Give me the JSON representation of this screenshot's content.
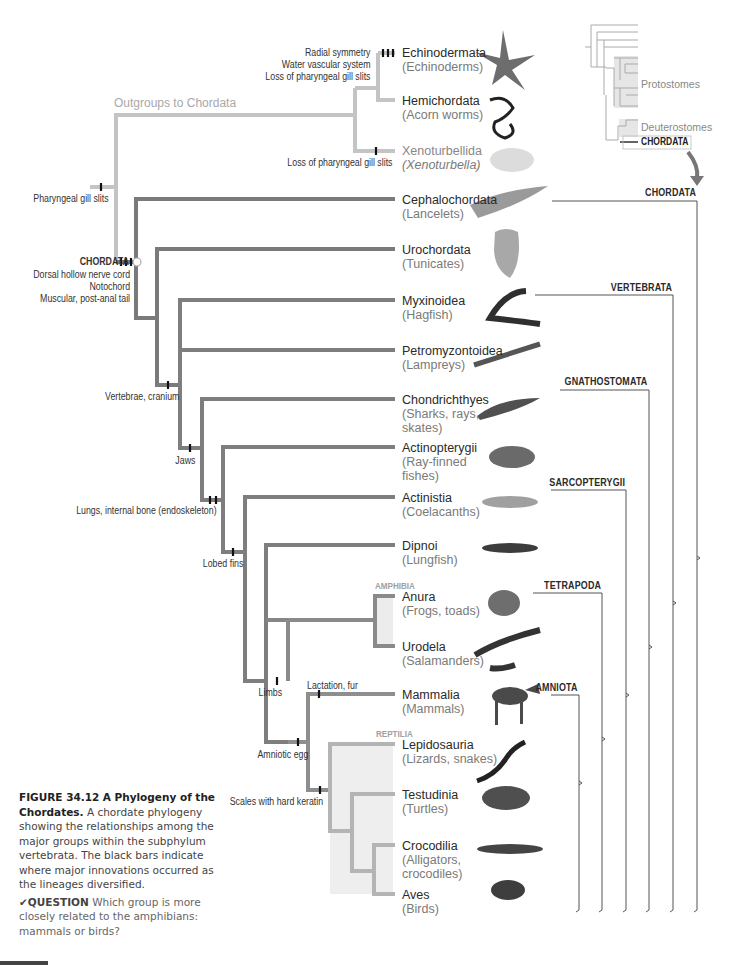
{
  "figure": {
    "number": "FIGURE 34.12",
    "title": "A Phylogeny of the Chordates.",
    "caption": "A chordate phylogeny showing the relationships among the major groups within the subphylum vertebrata. The black bars indicate where major innovations occurred as the lineages diversified.",
    "question_label": "QUESTION",
    "question_text": "Which group is more closely related to the amphibians: mammals or birds?",
    "question_icon": "checkmark-icon"
  },
  "inset": {
    "protostomes": "Protostomes",
    "deuterostomes": "Deuterostomes",
    "chordata": "CHORDATA",
    "arrow_icon": "curved-arrow-down-icon"
  },
  "outgroup_label": "Outgroups to Chordata",
  "taxa": [
    {
      "name": "Echinodermata",
      "common": "(Echinoderms)",
      "image": "sea-star"
    },
    {
      "name": "Hemichordata",
      "common": "(Acorn worms)",
      "image": "acorn-worm"
    },
    {
      "name": "Xenoturbellida",
      "common": "(Xenoturbella)",
      "image": "xenoturbella"
    },
    {
      "name": "Cephalochordata",
      "common": "(Lancelets)",
      "image": "lancelet"
    },
    {
      "name": "Urochordata",
      "common": "(Tunicates)",
      "image": "tunicate"
    },
    {
      "name": "Myxinoidea",
      "common": "(Hagfish)",
      "image": "hagfish"
    },
    {
      "name": "Petromyzontoidea",
      "common": "(Lampreys)",
      "image": "lamprey"
    },
    {
      "name": "Chondrichthyes",
      "common": "(Sharks, rays,",
      "common2": "skates)",
      "image": "shark"
    },
    {
      "name": "Actinopterygii",
      "common": "(Ray-finned",
      "common2": "fishes)",
      "image": "ray-finned-fish"
    },
    {
      "name": "Actinistia",
      "common": "(Coelacanths)",
      "image": "coelacanth"
    },
    {
      "name": "Dipnoi",
      "common": "(Lungfish)",
      "image": "lungfish"
    },
    {
      "name": "Anura",
      "common": "(Frogs, toads)",
      "image": "frog"
    },
    {
      "name": "Urodela",
      "common": "(Salamanders)",
      "image": "salamander"
    },
    {
      "name": "Mammalia",
      "common": "(Mammals)",
      "image": "deer"
    },
    {
      "name": "Lepidosauria",
      "common": "(Lizards, snakes)",
      "image": "snake"
    },
    {
      "name": "Testudinia",
      "common": "(Turtles)",
      "image": "turtle"
    },
    {
      "name": "Crocodilia",
      "common": "(Alligators,",
      "common2": "crocodiles)",
      "image": "alligator"
    },
    {
      "name": "Aves",
      "common": "(Birds)",
      "image": "bird"
    }
  ],
  "traits": {
    "echinoderm": [
      "Radial symmetry",
      "Water vascular system",
      "Loss of pharyngeal gill slits"
    ],
    "xeno": "Loss of pharyngeal gill slits",
    "gill_slits": "Pharyngeal gill slits",
    "chordata_title": "CHORDATA",
    "chordata": [
      "Dorsal hollow nerve cord",
      "Notochord",
      "Muscular, post-anal tail"
    ],
    "vertebrae": "Vertebrae, cranium",
    "jaws": "Jaws",
    "lungs": "Lungs, internal bone (endoskeleton)",
    "lobed": "Lobed fins",
    "limbs": "Limbs",
    "amniotic": "Amniotic egg",
    "lactation": "Lactation, fur",
    "scales": "Scales with hard keratin"
  },
  "group_labels": {
    "amphibia": "AMPHIBIA",
    "reptilia": "REPTILIA"
  },
  "brackets": [
    {
      "label": "CHORDATA",
      "top_y": 201
    },
    {
      "label": "VERTEBRATA",
      "top_y": 295
    },
    {
      "label": "GNATHOSTOMATA",
      "top_y": 390
    },
    {
      "label": "SARCOPTERYGII",
      "top_y": 490
    },
    {
      "label": "TETRAPODA",
      "top_y": 593
    },
    {
      "label": "AMNIOTA",
      "top_y": 695
    }
  ],
  "colors": {
    "outgroup_branch": "#c4c4c4",
    "dark_branch": "#6e6e6e",
    "mid_branch": "#8a8a8a",
    "light_branch": "#b4b4b4",
    "synapomorphy_bar": "#111111",
    "clade_shading": "#efefef"
  }
}
